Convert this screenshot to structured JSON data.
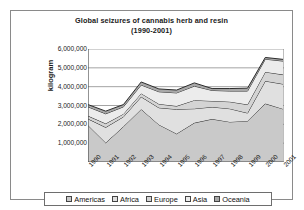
{
  "chart_data": {
    "type": "area",
    "stacked": true,
    "title": "Global seizures of cannabis herb and resin",
    "subtitle": "(1990-2001)",
    "xlabel": "",
    "ylabel": "kilogram",
    "ylim": [
      0,
      6000000
    ],
    "ytick_labels": [
      "6,000,000",
      "5,000,000",
      "4,000,000",
      "3,000,000",
      "2,000,000",
      "1,000,000"
    ],
    "ytick_values": [
      6000000,
      5000000,
      4000000,
      3000000,
      2000000,
      1000000
    ],
    "grid": true,
    "legend_position": "bottom",
    "categories": [
      "1990",
      "1991",
      "1992",
      "1993",
      "1994",
      "1995",
      "1996",
      "1997",
      "1998",
      "1999",
      "2000",
      "2001"
    ],
    "series": [
      {
        "name": "Americas",
        "color": "#c9c9c9",
        "values": [
          1950000,
          1020000,
          1880000,
          2800000,
          1980000,
          1500000,
          2080000,
          2280000,
          2130000,
          2180000,
          3100000,
          2820000
        ]
      },
      {
        "name": "Africa",
        "color": "#e0e0e0",
        "values": [
          340000,
          820000,
          520000,
          660000,
          900000,
          1300000,
          750000,
          640000,
          700000,
          420000,
          1200000,
          1320000
        ]
      },
      {
        "name": "Europe",
        "color": "#d4d4d4",
        "values": [
          160000,
          200000,
          150000,
          180000,
          200000,
          170000,
          450000,
          320000,
          370000,
          450000,
          480000,
          500000
        ]
      },
      {
        "name": "Asia",
        "color": "#ececec",
        "values": [
          480000,
          520000,
          380000,
          450000,
          650000,
          700000,
          750000,
          560000,
          570000,
          720000,
          680000,
          720000
        ]
      },
      {
        "name": "Oceania",
        "color": "#a8a8a8",
        "values": [
          120000,
          140000,
          120000,
          160000,
          150000,
          150000,
          170000,
          100000,
          130000,
          150000,
          90000,
          90000
        ]
      }
    ],
    "totals": [
      3050000,
      2700000,
      3050000,
      4250000,
      3880000,
      3820000,
      4200000,
      3900000,
      3900000,
      3920000,
      5550000,
      5450000
    ]
  },
  "legend": {
    "items": [
      {
        "label": "Americas"
      },
      {
        "label": "Africa"
      },
      {
        "label": "Europe"
      },
      {
        "label": "Asia"
      },
      {
        "label": "Oceania"
      }
    ]
  }
}
